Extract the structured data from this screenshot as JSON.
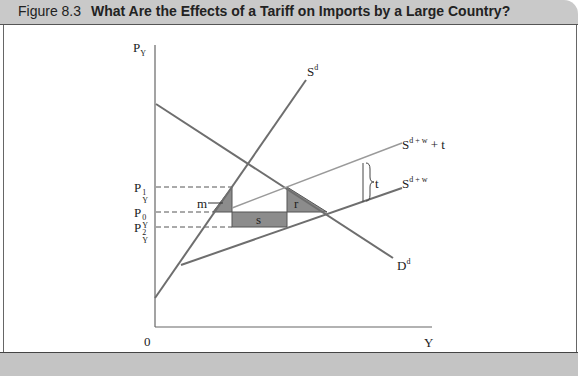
{
  "figure": {
    "number": "Figure 8.3",
    "title": "What Are the Effects of a Tariff on Imports by a Large Country?"
  },
  "axes": {
    "y_label": "P",
    "y_label_sub": "Y",
    "x_label": "Y",
    "origin": "0"
  },
  "curves": {
    "domestic_supply": {
      "label": "S",
      "sup": "d"
    },
    "domestic_demand": {
      "label": "D",
      "sup": "d"
    },
    "world_supply": {
      "label": "S",
      "sup": "d + w"
    },
    "world_supply_tariff": {
      "label": "S",
      "sup": "d + w",
      "suffix": "+ t"
    }
  },
  "price_levels": [
    {
      "label": "P",
      "sup": "1",
      "sub": "Y"
    },
    {
      "label": "P",
      "sup": "0",
      "sub": "Y"
    },
    {
      "label": "P",
      "sup": "2",
      "sub": "Y"
    }
  ],
  "areas": {
    "m": "m",
    "s": "s",
    "r": "r"
  },
  "tariff_bracket": "t",
  "colors": {
    "line": "#6e6e6e",
    "shade": "#8c8c8c",
    "title_bg": "#c9c9c9"
  }
}
